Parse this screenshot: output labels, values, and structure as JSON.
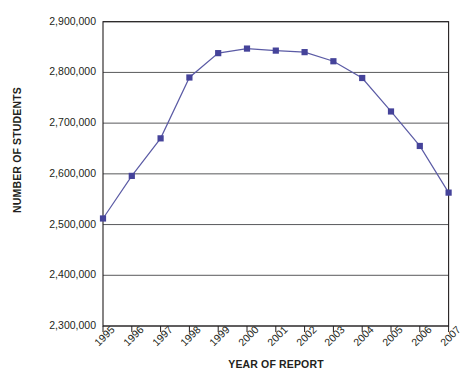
{
  "chart_data": {
    "type": "line",
    "title": "",
    "xlabel": "YEAR OF REPORT",
    "ylabel": "NUMBER OF STUDENTS",
    "categories": [
      "1995",
      "1996",
      "1997",
      "1998",
      "1999",
      "2000",
      "2001",
      "2002",
      "2003",
      "2004",
      "2005",
      "2006",
      "2007"
    ],
    "values": [
      2512000,
      2596000,
      2670000,
      2790000,
      2838000,
      2847000,
      2843000,
      2840000,
      2822000,
      2789000,
      2723000,
      2655000,
      2563000
    ],
    "series": [
      {
        "name": "Number of students",
        "values": [
          2512000,
          2596000,
          2670000,
          2790000,
          2838000,
          2847000,
          2843000,
          2840000,
          2822000,
          2789000,
          2723000,
          2655000,
          2563000
        ]
      }
    ],
    "ylim": [
      2300000,
      2900000
    ],
    "ytick_values": [
      2900000,
      2800000,
      2700000,
      2600000,
      2500000,
      2400000,
      2300000
    ],
    "ytick_labels": [
      "2,900,000",
      "2,800,000",
      "2,700,000",
      "2,600,000",
      "2,500,000",
      "2,400,000",
      "2,300,000"
    ],
    "grid": true,
    "grid_axis": "y",
    "legend": false,
    "legend_position": "none",
    "marker": "square",
    "line_color": "#5b5ba5",
    "marker_color": "#45439a",
    "grid_color": "#58595b",
    "axis_color": "#231f20",
    "background": "#ffffff"
  },
  "axes": {
    "y_title": "NUMBER OF STUDENTS",
    "x_title": "YEAR OF REPORT"
  }
}
